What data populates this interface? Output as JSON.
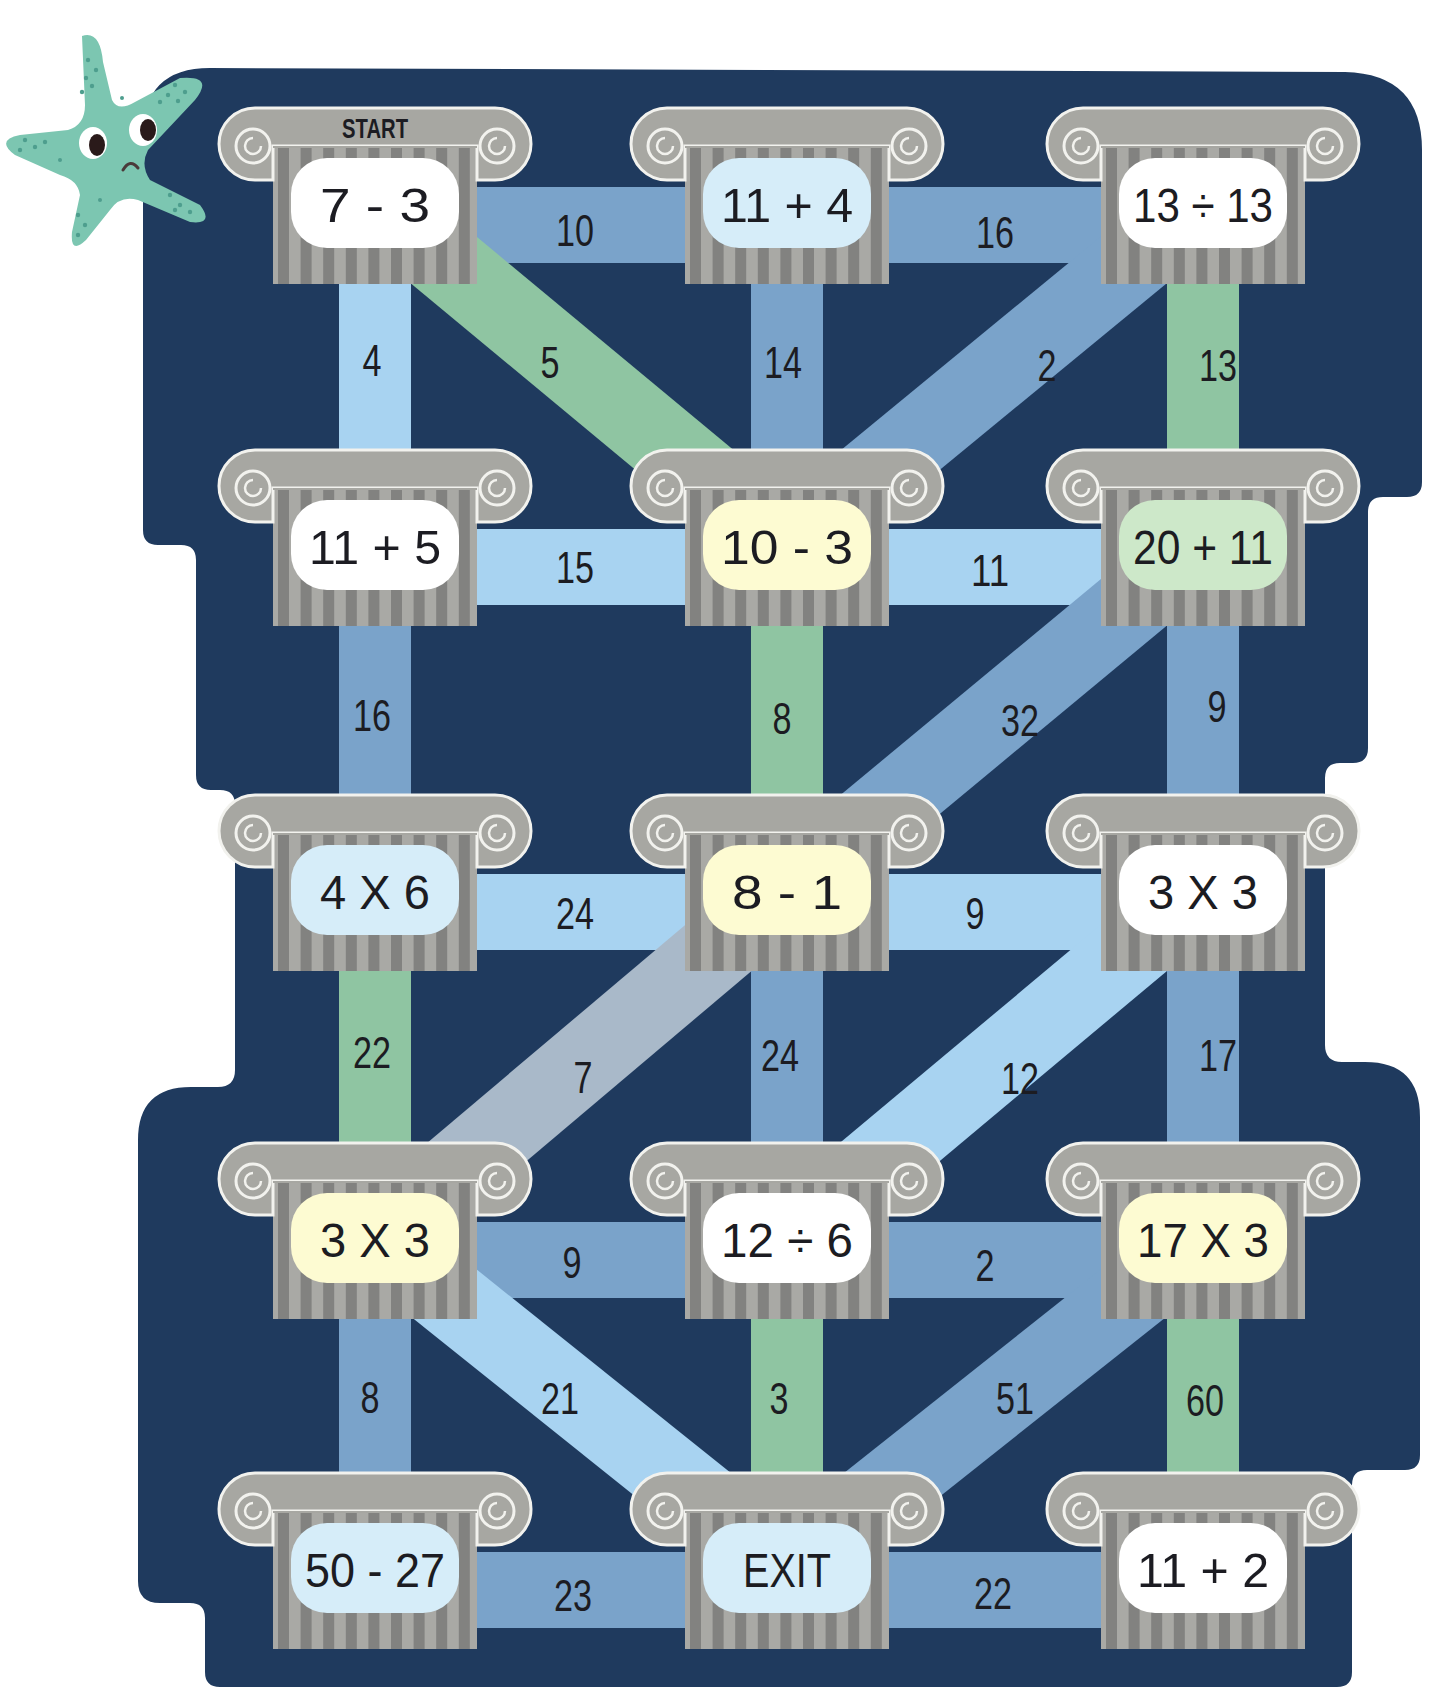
{
  "puzzle": {
    "start_label": "START",
    "colors": {
      "board": "#1f3a5e",
      "bar_medium_blue": "#7aa3ca",
      "bar_light_blue": "#a8d3f1",
      "bar_green": "#8fc5a2",
      "bar_gray": "#a9b9c9",
      "pillar_capital": "#a7a7a2",
      "pillar_stripe_dark": "#828280",
      "pillar_stripe_light": "#a9a9a5",
      "label_white": "#ffffff",
      "label_light_blue": "#d6edf9",
      "label_yellow": "#fdfbd2",
      "label_green": "#cde8c9",
      "starfish": "#7cc6b1"
    },
    "nodes": [
      {
        "id": "r1c1",
        "row": 1,
        "col": 1,
        "text": "7 - 3",
        "fill": "label_white",
        "is_start": true
      },
      {
        "id": "r1c2",
        "row": 1,
        "col": 2,
        "text": "11 + 4",
        "fill": "label_light_blue"
      },
      {
        "id": "r1c3",
        "row": 1,
        "col": 3,
        "text": "13 ÷ 13",
        "fill": "label_white"
      },
      {
        "id": "r2c1",
        "row": 2,
        "col": 1,
        "text": "11 + 5",
        "fill": "label_white"
      },
      {
        "id": "r2c2",
        "row": 2,
        "col": 2,
        "text": "10 - 3",
        "fill": "label_yellow"
      },
      {
        "id": "r2c3",
        "row": 2,
        "col": 3,
        "text": "20 + 11",
        "fill": "label_green"
      },
      {
        "id": "r3c1",
        "row": 3,
        "col": 1,
        "text": "4 X 6",
        "fill": "label_light_blue"
      },
      {
        "id": "r3c2",
        "row": 3,
        "col": 2,
        "text": "8 - 1",
        "fill": "label_yellow"
      },
      {
        "id": "r3c3",
        "row": 3,
        "col": 3,
        "text": "3 X 3",
        "fill": "label_white"
      },
      {
        "id": "r4c1",
        "row": 4,
        "col": 1,
        "text": "3 X 3",
        "fill": "label_yellow"
      },
      {
        "id": "r4c2",
        "row": 4,
        "col": 2,
        "text": "12 ÷ 6",
        "fill": "label_white"
      },
      {
        "id": "r4c3",
        "row": 4,
        "col": 3,
        "text": "17 X 3",
        "fill": "label_yellow"
      },
      {
        "id": "r5c1",
        "row": 5,
        "col": 1,
        "text": "50 - 27",
        "fill": "label_light_blue"
      },
      {
        "id": "r5c2",
        "row": 5,
        "col": 2,
        "text": "EXIT",
        "fill": "label_light_blue",
        "is_exit": true
      },
      {
        "id": "r5c3",
        "row": 5,
        "col": 3,
        "text": "11 + 2",
        "fill": "label_white"
      }
    ],
    "edges": [
      {
        "from": "r1c1",
        "to": "r1c2",
        "value": "10",
        "color": "bar_medium_blue",
        "lx": 575,
        "ly": 230
      },
      {
        "from": "r1c2",
        "to": "r1c3",
        "value": "16",
        "color": "bar_medium_blue",
        "lx": 995,
        "ly": 232
      },
      {
        "from": "r1c1",
        "to": "r2c1",
        "value": "4",
        "color": "bar_light_blue",
        "lx": 372,
        "ly": 360
      },
      {
        "from": "r1c1",
        "to": "r2c2",
        "value": "5",
        "color": "bar_green",
        "lx": 550,
        "ly": 362
      },
      {
        "from": "r1c2",
        "to": "r2c2",
        "value": "14",
        "color": "bar_medium_blue",
        "lx": 783,
        "ly": 362
      },
      {
        "from": "r1c3",
        "to": "r2c2",
        "value": "2",
        "color": "bar_medium_blue",
        "lx": 1047,
        "ly": 365
      },
      {
        "from": "r1c3",
        "to": "r2c3",
        "value": "13",
        "color": "bar_green",
        "lx": 1218,
        "ly": 365
      },
      {
        "from": "r2c1",
        "to": "r2c2",
        "value": "15",
        "color": "bar_light_blue",
        "lx": 575,
        "ly": 567
      },
      {
        "from": "r2c2",
        "to": "r2c3",
        "value": "11",
        "color": "bar_light_blue",
        "lx": 990,
        "ly": 570
      },
      {
        "from": "r2c1",
        "to": "r3c1",
        "value": "16",
        "color": "bar_medium_blue",
        "lx": 372,
        "ly": 715
      },
      {
        "from": "r2c2",
        "to": "r3c2",
        "value": "8",
        "color": "bar_green",
        "lx": 782,
        "ly": 718
      },
      {
        "from": "r2c3",
        "to": "r3c2",
        "value": "32",
        "color": "bar_medium_blue",
        "lx": 1020,
        "ly": 720
      },
      {
        "from": "r2c3",
        "to": "r3c3",
        "value": "9",
        "color": "bar_medium_blue",
        "lx": 1217,
        "ly": 706
      },
      {
        "from": "r3c1",
        "to": "r3c2",
        "value": "24",
        "color": "bar_light_blue",
        "lx": 575,
        "ly": 913
      },
      {
        "from": "r3c2",
        "to": "r3c3",
        "value": "9",
        "color": "bar_light_blue",
        "lx": 975,
        "ly": 913
      },
      {
        "from": "r3c1",
        "to": "r4c1",
        "value": "22",
        "color": "bar_green",
        "lx": 372,
        "ly": 1052
      },
      {
        "from": "r3c2",
        "to": "r4c1",
        "value": "7",
        "color": "bar_gray",
        "lx": 583,
        "ly": 1077
      },
      {
        "from": "r3c2",
        "to": "r4c2",
        "value": "24",
        "color": "bar_medium_blue",
        "lx": 780,
        "ly": 1055
      },
      {
        "from": "r3c3",
        "to": "r4c2",
        "value": "12",
        "color": "bar_light_blue",
        "lx": 1020,
        "ly": 1078
      },
      {
        "from": "r3c3",
        "to": "r4c3",
        "value": "17",
        "color": "bar_medium_blue",
        "lx": 1218,
        "ly": 1055
      },
      {
        "from": "r4c1",
        "to": "r4c2",
        "value": "9",
        "color": "bar_medium_blue",
        "lx": 572,
        "ly": 1262
      },
      {
        "from": "r4c2",
        "to": "r4c3",
        "value": "2",
        "color": "bar_medium_blue",
        "lx": 985,
        "ly": 1265
      },
      {
        "from": "r4c1",
        "to": "r5c1",
        "value": "8",
        "color": "bar_medium_blue",
        "lx": 370,
        "ly": 1397
      },
      {
        "from": "r4c1",
        "to": "r5c2",
        "value": "21",
        "color": "bar_light_blue",
        "lx": 560,
        "ly": 1398
      },
      {
        "from": "r4c2",
        "to": "r5c2",
        "value": "3",
        "color": "bar_green",
        "lx": 779,
        "ly": 1398
      },
      {
        "from": "r4c3",
        "to": "r5c2",
        "value": "51",
        "color": "bar_medium_blue",
        "lx": 1015,
        "ly": 1398
      },
      {
        "from": "r4c3",
        "to": "r5c3",
        "value": "60",
        "color": "bar_green",
        "lx": 1205,
        "ly": 1400
      },
      {
        "from": "r5c1",
        "to": "r5c2",
        "value": "23",
        "color": "bar_medium_blue",
        "lx": 573,
        "ly": 1595
      },
      {
        "from": "r5c2",
        "to": "r5c3",
        "value": "22",
        "color": "bar_medium_blue",
        "lx": 993,
        "ly": 1593
      }
    ]
  }
}
